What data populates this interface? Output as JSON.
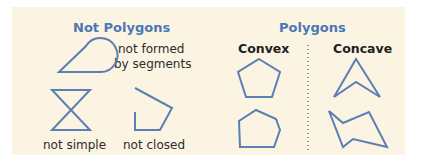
{
  "left": {
    "title": "Not Polygons",
    "examples": [
      {
        "label_line1": "not formed",
        "label_line2": "by segments",
        "shape": "teardrop-shape"
      },
      {
        "label": "not simple",
        "shape": "hourglass-shape"
      },
      {
        "label": "not closed",
        "shape": "open-pentagon-shape"
      }
    ]
  },
  "right": {
    "title": "Polygons",
    "columns": [
      {
        "label": "Convex",
        "shapes": [
          "pentagon-shape",
          "hexagon-shape"
        ]
      },
      {
        "label": "Concave",
        "shapes": [
          "arrowhead-shape",
          "zigzag-shape"
        ]
      }
    ]
  },
  "colors": {
    "background": "#fcf4e2",
    "heading": "#4a77b5",
    "stroke": "#5b7fb3",
    "text": "#2b2b2b"
  }
}
